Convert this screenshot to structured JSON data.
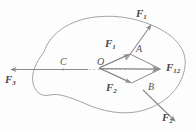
{
  "figure": {
    "background_color": "#fdfdfd",
    "stroke_color": "#8a8a8a",
    "label_color": "#4a4a4a",
    "point_color": "#555555",
    "body_outline_name": "rigid-body-outline",
    "dashed_line_name": "line-of-action"
  },
  "labels": {
    "force_1_external": "F",
    "force_1_external_sub": "1",
    "force_1_component": "F",
    "force_1_component_sub": "1",
    "force_2_external": "F",
    "force_2_external_sub": "2",
    "force_2_component": "F",
    "force_2_component_sub": "2",
    "force_3": "F",
    "force_3_sub": "3",
    "resultant": "F",
    "resultant_sub": "12"
  },
  "points": {
    "o": "O",
    "a": "A",
    "b": "B",
    "c": "C"
  },
  "geometry": {
    "origin": [
      99,
      68
    ],
    "point_a": [
      130,
      54
    ],
    "point_b": [
      132,
      83
    ],
    "resultant_tip": [
      160,
      69
    ],
    "point_c": [
      63,
      70
    ],
    "f3_tip": [
      9,
      70
    ],
    "f1_ext_tail": [
      128,
      57
    ],
    "f1_ext_tip": [
      152,
      25
    ],
    "f2_ext_tail": [
      144,
      92
    ],
    "f2_ext_tip": [
      176,
      122
    ]
  }
}
